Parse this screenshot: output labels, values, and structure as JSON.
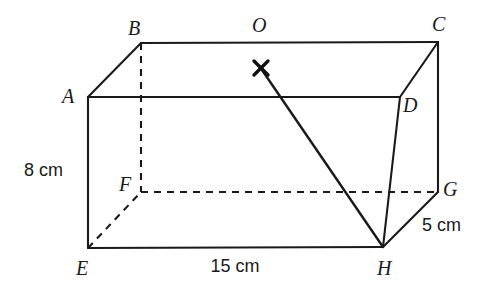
{
  "figure": {
    "kind": "geometry-diagram",
    "shape": "rectangular-cuboid",
    "background_color": "#ffffff",
    "line_color": "#1a1a1a"
  },
  "vertices": [
    {
      "id": "A",
      "label": "A",
      "x": 88,
      "y": 97,
      "label_x": 62,
      "label_y": 103,
      "hidden": false
    },
    {
      "id": "B",
      "label": "B",
      "x": 141,
      "y": 43,
      "label_x": 128,
      "label_y": 35,
      "hidden": false
    },
    {
      "id": "C",
      "label": "C",
      "x": 438,
      "y": 42,
      "label_x": 432,
      "label_y": 31,
      "hidden": false
    },
    {
      "id": "D",
      "label": "D",
      "x": 400,
      "y": 97,
      "label_x": 403,
      "label_y": 112,
      "hidden": false
    },
    {
      "id": "E",
      "label": "E",
      "x": 88,
      "y": 248,
      "label_x": 76,
      "label_y": 275,
      "hidden": false
    },
    {
      "id": "F",
      "label": "F",
      "x": 141,
      "y": 192,
      "label_x": 119,
      "label_y": 191,
      "hidden": true
    },
    {
      "id": "G",
      "label": "G",
      "x": 438,
      "y": 192,
      "label_x": 443,
      "label_y": 196,
      "hidden": false
    },
    {
      "id": "H",
      "label": "H",
      "x": 383,
      "y": 247,
      "label_x": 377,
      "label_y": 275,
      "hidden": false
    }
  ],
  "edges": [
    {
      "name": "AB",
      "from": "A",
      "to": "B",
      "style": "solid"
    },
    {
      "name": "BC",
      "from": "B",
      "to": "C",
      "style": "solid"
    },
    {
      "name": "CD",
      "from": "C",
      "to": "D",
      "style": "solid"
    },
    {
      "name": "DA",
      "from": "D",
      "to": "A",
      "style": "solid"
    },
    {
      "name": "EH",
      "from": "E",
      "to": "H",
      "style": "solid"
    },
    {
      "name": "HG",
      "from": "H",
      "to": "G",
      "style": "solid"
    },
    {
      "name": "GC",
      "from": "G",
      "to": "C",
      "style": "solid"
    },
    {
      "name": "AE",
      "from": "A",
      "to": "E",
      "style": "solid"
    },
    {
      "name": "DH",
      "from": "D",
      "to": "H",
      "style": "solid"
    },
    {
      "name": "BF",
      "from": "B",
      "to": "F",
      "style": "dashed"
    },
    {
      "name": "EF",
      "from": "E",
      "to": "F",
      "style": "dashed"
    },
    {
      "name": "FG",
      "from": "F",
      "to": "G",
      "style": "dashed"
    }
  ],
  "annotations": {
    "point_marker": {
      "name": "X",
      "x": 261,
      "y": 68,
      "arm": 7
    },
    "point_label": {
      "text": "O",
      "x": 252,
      "y": 32
    },
    "diagonal": {
      "name": "OH",
      "from_x": 262,
      "from_y": 70,
      "to_x": 383,
      "to_y": 247
    }
  },
  "dimensions": [
    {
      "name": "height",
      "text": "8 cm",
      "x": 24,
      "y": 176,
      "anchor": "start"
    },
    {
      "name": "length",
      "text": "15 cm",
      "x": 235,
      "y": 272,
      "anchor": "middle"
    },
    {
      "name": "depth",
      "text": "5 cm",
      "x": 422,
      "y": 231,
      "anchor": "start"
    }
  ]
}
